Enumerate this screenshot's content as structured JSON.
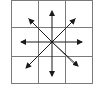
{
  "diagram": {
    "type": "grid-with-radial-arrows",
    "grid": {
      "rows": 3,
      "cols": 3,
      "line_color": "#7a7a7a"
    },
    "arrows": [
      {
        "direction": "up"
      },
      {
        "direction": "down"
      },
      {
        "direction": "left"
      },
      {
        "direction": "right"
      },
      {
        "direction": "up-left"
      },
      {
        "direction": "up-right"
      },
      {
        "direction": "down-left"
      },
      {
        "direction": "down-right"
      }
    ],
    "arrow_color": "#1a1a1a"
  }
}
